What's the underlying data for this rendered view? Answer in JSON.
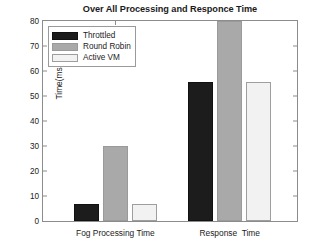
{
  "chart_data": {
    "type": "bar",
    "title": "Over All Processing and Responce Time",
    "xlabel": "",
    "ylabel": "Time(ms)",
    "categories": [
      "Fog Processing Time",
      "Response  Time"
    ],
    "series": [
      {
        "name": "Throttled",
        "color": "#1c1c1c",
        "values": [
          6.7,
          55.8
        ]
      },
      {
        "name": "Round Robin",
        "color": "#a9a9a9",
        "values": [
          29.9,
          80.0
        ]
      },
      {
        "name": "Active VM",
        "color": "#f2f2f2",
        "values": [
          6.7,
          55.8
        ]
      }
    ],
    "ylim": [
      0,
      80
    ],
    "yticks": [
      0,
      10,
      20,
      30,
      40,
      50,
      60,
      70,
      80
    ],
    "ytick_labels": [
      "0",
      "10",
      "20",
      "30",
      "40",
      "50",
      "60",
      "70",
      "80"
    ],
    "grid": false,
    "legend_position": "upper left"
  },
  "axis": {
    "ylabel": "Time(ms)",
    "title": "Over All Processing and Responce Time"
  },
  "legend": {
    "entries": [
      {
        "label": "Throttled"
      },
      {
        "label": "Round Robin"
      },
      {
        "label": "Active VM"
      }
    ]
  }
}
